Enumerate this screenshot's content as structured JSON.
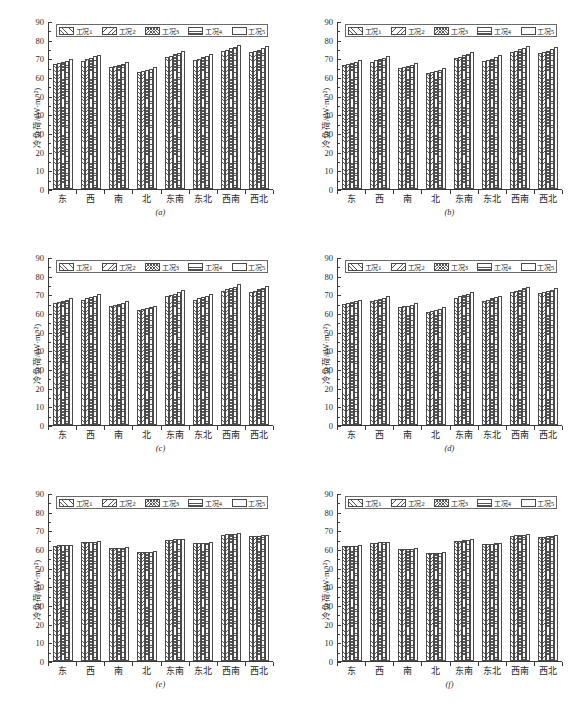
{
  "figure": {
    "name": "cooling-load-by-orientation-six-panels",
    "panel_count": 6
  },
  "axis": {
    "ylabel": "冷负荷/(W·m⁻²)",
    "yticks": [
      0,
      10,
      20,
      30,
      40,
      50,
      60,
      70,
      80,
      90
    ],
    "ylim": [
      0,
      90
    ],
    "categories": [
      "东",
      "西",
      "南",
      "北",
      "东南",
      "东北",
      "西南",
      "西北"
    ]
  },
  "legend": {
    "items": [
      {
        "label": "工况1",
        "pattern": "forward-diagonal"
      },
      {
        "label": "工况2",
        "pattern": "back-diagonal"
      },
      {
        "label": "工况3",
        "pattern": "cross-hatch"
      },
      {
        "label": "工况4",
        "pattern": "horizontal"
      },
      {
        "label": "工况5",
        "pattern": "blank"
      }
    ]
  },
  "captions": {
    "a": "(a)",
    "b": "(b)",
    "c": "(c)",
    "d": "(d)",
    "e": "(e)",
    "f": "(f)"
  },
  "chart_data": [
    {
      "type": "bar",
      "panel": "(a)",
      "title": "",
      "xlabel": "",
      "ylabel": "冷负荷/(W·m⁻²)",
      "ylim": [
        0,
        90
      ],
      "grid": false,
      "legend_position": "top",
      "categories": [
        "东",
        "西",
        "南",
        "北",
        "东南",
        "东北",
        "西南",
        "西北"
      ],
      "series": [
        {
          "name": "工况1",
          "values": [
            67.0,
            68.8,
            65.2,
            62.8,
            70.6,
            69.0,
            73.8,
            73.2
          ]
        },
        {
          "name": "工况2",
          "values": [
            67.6,
            69.6,
            65.8,
            63.3,
            71.4,
            69.8,
            74.6,
            73.9
          ]
        },
        {
          "name": "工况3",
          "values": [
            68.2,
            70.3,
            66.4,
            63.8,
            72.1,
            70.5,
            75.4,
            74.6
          ]
        },
        {
          "name": "工况4",
          "values": [
            68.8,
            71.0,
            67.0,
            64.4,
            72.9,
            71.2,
            76.2,
            75.4
          ]
        },
        {
          "name": "工况5",
          "values": [
            69.6,
            71.9,
            68.0,
            65.3,
            74.0,
            72.3,
            77.3,
            76.6
          ]
        }
      ]
    },
    {
      "type": "bar",
      "panel": "(b)",
      "title": "",
      "xlabel": "",
      "ylabel": "冷负荷/(W·m⁻²)",
      "ylim": [
        0,
        90
      ],
      "grid": false,
      "legend_position": "top",
      "categories": [
        "东",
        "西",
        "南",
        "北",
        "东南",
        "东北",
        "西南",
        "西北"
      ],
      "series": [
        {
          "name": "工况1",
          "values": [
            66.5,
            68.3,
            64.6,
            62.2,
            70.2,
            68.5,
            73.3,
            72.7
          ]
        },
        {
          "name": "工况2",
          "values": [
            67.1,
            69.0,
            65.2,
            62.8,
            70.9,
            69.2,
            74.1,
            73.4
          ]
        },
        {
          "name": "工况3",
          "values": [
            67.7,
            69.7,
            65.8,
            63.3,
            71.6,
            69.9,
            74.8,
            74.1
          ]
        },
        {
          "name": "工况4",
          "values": [
            68.3,
            70.4,
            66.4,
            63.9,
            72.4,
            70.6,
            75.6,
            74.9
          ]
        },
        {
          "name": "工况5",
          "values": [
            69.1,
            71.4,
            67.4,
            64.8,
            73.5,
            71.7,
            76.8,
            76.1
          ]
        }
      ]
    },
    {
      "type": "bar",
      "panel": "(c)",
      "title": "",
      "xlabel": "",
      "ylabel": "冷负荷/(W·m⁻²)",
      "ylim": [
        0,
        90
      ],
      "grid": false,
      "legend_position": "top",
      "categories": [
        "东",
        "西",
        "南",
        "北",
        "东南",
        "东北",
        "西南",
        "西北"
      ],
      "series": [
        {
          "name": "工况1",
          "values": [
            65.4,
            67.1,
            63.6,
            61.4,
            68.9,
            67.2,
            71.8,
            71.2
          ]
        },
        {
          "name": "工况2",
          "values": [
            66.0,
            67.8,
            64.2,
            61.9,
            69.6,
            67.9,
            72.6,
            71.9
          ]
        },
        {
          "name": "工况3",
          "values": [
            66.6,
            68.5,
            64.8,
            62.5,
            70.3,
            68.6,
            73.3,
            72.6
          ]
        },
        {
          "name": "工况4",
          "values": [
            67.2,
            69.2,
            65.4,
            63.0,
            71.1,
            69.3,
            74.1,
            73.4
          ]
        },
        {
          "name": "工况5",
          "values": [
            68.0,
            70.2,
            66.4,
            63.9,
            72.2,
            70.4,
            75.3,
            74.6
          ]
        }
      ]
    },
    {
      "type": "bar",
      "panel": "(d)",
      "title": "",
      "xlabel": "",
      "ylabel": "冷负荷/(W·m⁻²)",
      "ylim": [
        0,
        90
      ],
      "grid": false,
      "legend_position": "top",
      "categories": [
        "东",
        "西",
        "南",
        "北",
        "东南",
        "东北",
        "西南",
        "西北"
      ],
      "series": [
        {
          "name": "工况1",
          "values": [
            64.8,
            66.5,
            63.0,
            60.8,
            68.3,
            66.6,
            71.2,
            70.6
          ]
        },
        {
          "name": "工况2",
          "values": [
            65.3,
            67.1,
            63.5,
            61.3,
            68.9,
            67.2,
            71.9,
            71.2
          ]
        },
        {
          "name": "工况3",
          "values": [
            65.8,
            67.7,
            64.0,
            61.8,
            69.5,
            67.8,
            72.5,
            71.8
          ]
        },
        {
          "name": "工况4",
          "values": [
            66.3,
            68.3,
            64.5,
            62.2,
            70.2,
            68.4,
            73.2,
            72.5
          ]
        },
        {
          "name": "工况5",
          "values": [
            67.0,
            69.1,
            65.3,
            63.0,
            71.1,
            69.3,
            74.2,
            73.5
          ]
        }
      ]
    },
    {
      "type": "bar",
      "panel": "(e)",
      "title": "",
      "xlabel": "",
      "ylabel": "冷负荷/(W·m⁻²)",
      "ylim": [
        0,
        90
      ],
      "grid": false,
      "legend_position": "top",
      "categories": [
        "东",
        "西",
        "南",
        "北",
        "东南",
        "东北",
        "西南",
        "西北"
      ],
      "series": [
        {
          "name": "工况1",
          "values": [
            61.8,
            63.6,
            60.3,
            58.2,
            64.8,
            63.1,
            67.6,
            66.9
          ]
        },
        {
          "name": "工况2",
          "values": [
            61.9,
            63.8,
            60.4,
            58.3,
            64.9,
            63.2,
            67.8,
            67.1
          ]
        },
        {
          "name": "工况3",
          "values": [
            62.0,
            63.9,
            60.5,
            58.4,
            65.1,
            63.3,
            67.9,
            67.2
          ]
        },
        {
          "name": "工况4",
          "values": [
            62.1,
            64.0,
            60.6,
            58.5,
            65.2,
            63.4,
            68.0,
            67.3
          ]
        },
        {
          "name": "工况5",
          "values": [
            62.3,
            64.3,
            60.9,
            58.8,
            65.5,
            63.7,
            68.4,
            67.7
          ]
        }
      ]
    },
    {
      "type": "bar",
      "panel": "(f)",
      "title": "",
      "xlabel": "",
      "ylabel": "冷负荷/(W·m⁻²)",
      "ylim": [
        0,
        90
      ],
      "grid": false,
      "legend_position": "top",
      "categories": [
        "东",
        "西",
        "南",
        "北",
        "东南",
        "东北",
        "西南",
        "西北"
      ],
      "series": [
        {
          "name": "工况1",
          "values": [
            61.4,
            63.2,
            59.9,
            57.8,
            64.4,
            62.7,
            67.2,
            66.5
          ]
        },
        {
          "name": "工况2",
          "values": [
            61.5,
            63.3,
            60.0,
            57.9,
            64.5,
            62.8,
            67.3,
            66.6
          ]
        },
        {
          "name": "工况3",
          "values": [
            61.6,
            63.5,
            60.1,
            58.0,
            64.6,
            62.9,
            67.5,
            66.8
          ]
        },
        {
          "name": "工况4",
          "values": [
            61.7,
            63.6,
            60.2,
            58.1,
            64.8,
            63.0,
            67.6,
            66.9
          ]
        },
        {
          "name": "工况5",
          "values": [
            62.0,
            63.9,
            60.5,
            58.4,
            65.1,
            63.3,
            68.0,
            67.3
          ]
        }
      ]
    }
  ]
}
